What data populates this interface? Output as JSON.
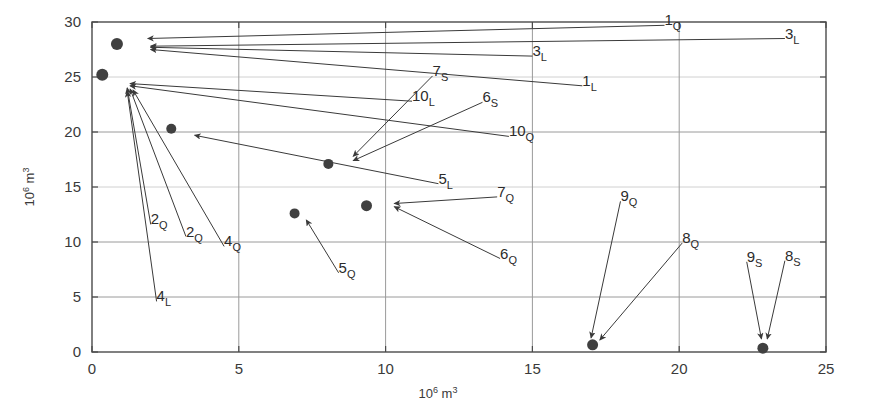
{
  "figure": {
    "background_color": "#ffffff",
    "axis_color": "#4a4a4a",
    "grid_color": "#9a9a9a",
    "marker_color": "#404040",
    "arrow_color": "#3a3a3a"
  },
  "chart_data": {
    "type": "scatter",
    "title": "",
    "xlabel": "10⁶ m³",
    "ylabel": "10⁶ m³",
    "xlim": [
      0,
      25
    ],
    "ylim": [
      0,
      30
    ],
    "xticks": [
      0,
      5,
      10,
      15,
      20,
      25
    ],
    "xtick_labels": [
      "0",
      "5",
      "10",
      "15",
      "20",
      "25"
    ],
    "yticks": [
      0,
      5,
      10,
      15,
      20,
      25,
      30
    ],
    "ytick_labels": [
      "0",
      "5",
      "10",
      "15",
      "20",
      "25",
      "30"
    ],
    "grid": true,
    "grid_x": [
      5,
      10,
      15,
      20
    ],
    "grid_y": [
      5,
      10,
      15,
      20,
      25
    ],
    "legend": "none",
    "points": [
      {
        "label": "1",
        "sub": "Q",
        "x": 0.85,
        "y": 28.1
      },
      {
        "label": "3",
        "sub": "L",
        "x": 0.85,
        "y": 27.9
      },
      {
        "label": "3",
        "sub": "L",
        "x": 0.9,
        "y": 27.6
      },
      {
        "label": "1",
        "sub": "L",
        "x": 0.9,
        "y": 27.4
      },
      {
        "label": "10",
        "sub": "L",
        "x": 0.35,
        "y": 24.6
      },
      {
        "label": "10",
        "sub": "Q",
        "x": 2.7,
        "y": 20.3
      },
      {
        "label": "5",
        "sub": "L",
        "x": 2.7,
        "y": 20.3
      },
      {
        "label": "2",
        "sub": "Q",
        "x": 0.35,
        "y": 24.4
      },
      {
        "label": "2",
        "sub": "Q",
        "x": 0.35,
        "y": 24.3
      },
      {
        "label": "4",
        "sub": "Q",
        "x": 0.35,
        "y": 24.2
      },
      {
        "label": "4",
        "sub": "L",
        "x": 0.35,
        "y": 24.1
      },
      {
        "label": "7",
        "sub": "S",
        "x": 8.05,
        "y": 17.1
      },
      {
        "label": "6",
        "sub": "S",
        "x": 8.05,
        "y": 17.1
      },
      {
        "label": "7",
        "sub": "Q",
        "x": 9.35,
        "y": 13.3
      },
      {
        "label": "6",
        "sub": "Q",
        "x": 9.35,
        "y": 13.3
      },
      {
        "label": "5",
        "sub": "Q",
        "x": 6.9,
        "y": 12.6
      },
      {
        "label": "9",
        "sub": "Q",
        "x": 17.05,
        "y": 0.65
      },
      {
        "label": "8",
        "sub": "Q",
        "x": 17.05,
        "y": 0.65
      },
      {
        "label": "9",
        "sub": "S",
        "x": 22.85,
        "y": 0.35
      },
      {
        "label": "8",
        "sub": "S",
        "x": 22.85,
        "y": 0.35
      }
    ],
    "markers": [
      {
        "name": "cluster-top-left",
        "x": 0.85,
        "y": 28.0,
        "r": 6.0
      },
      {
        "name": "cluster-mid-left",
        "x": 0.35,
        "y": 25.2,
        "r": 6.0
      },
      {
        "name": "marker-10q-5l",
        "x": 2.7,
        "y": 20.3,
        "r": 5.0
      },
      {
        "name": "marker-7s-6s",
        "x": 8.05,
        "y": 17.1,
        "r": 5.0
      },
      {
        "name": "marker-7q-6q",
        "x": 9.35,
        "y": 13.3,
        "r": 5.5
      },
      {
        "name": "marker-5q",
        "x": 6.9,
        "y": 12.6,
        "r": 5.0
      },
      {
        "name": "marker-9q-8q",
        "x": 17.05,
        "y": 0.65,
        "r": 5.5
      },
      {
        "name": "marker-9s-8s",
        "x": 22.85,
        "y": 0.35,
        "r": 5.5
      }
    ],
    "annotations": [
      {
        "text": "1",
        "sub": "Q",
        "label_x": 19.5,
        "label_y": 29.7,
        "tip_x": 1.9,
        "tip_y": 28.5
      },
      {
        "text": "3",
        "sub": "L",
        "label_x": 23.6,
        "label_y": 28.5,
        "tip_x": 2.0,
        "tip_y": 27.8
      },
      {
        "text": "3",
        "sub": "L",
        "label_x": 15.0,
        "label_y": 26.9,
        "tip_x": 2.0,
        "tip_y": 27.7
      },
      {
        "text": "1",
        "sub": "L",
        "label_x": 16.7,
        "label_y": 24.2,
        "tip_x": 2.0,
        "tip_y": 27.5
      },
      {
        "text": "10",
        "sub": "L",
        "label_x": 10.9,
        "label_y": 22.8,
        "tip_x": 1.3,
        "tip_y": 24.4
      },
      {
        "text": "10",
        "sub": "Q",
        "label_x": 14.2,
        "label_y": 19.6,
        "tip_x": 1.3,
        "tip_y": 24.2
      },
      {
        "text": "5",
        "sub": "L",
        "label_x": 11.8,
        "label_y": 15.3,
        "tip_x": 3.5,
        "tip_y": 19.7
      },
      {
        "text": "2",
        "sub": "Q",
        "label_x": 2.0,
        "label_y": 11.6,
        "tip_x": 1.2,
        "tip_y": 24.0
      },
      {
        "text": "2",
        "sub": "Q",
        "label_x": 3.2,
        "label_y": 10.5,
        "tip_x": 1.3,
        "tip_y": 23.9
      },
      {
        "text": "4",
        "sub": "Q",
        "label_x": 4.5,
        "label_y": 9.6,
        "tip_x": 1.4,
        "tip_y": 23.8
      },
      {
        "text": "4",
        "sub": "L",
        "label_x": 2.2,
        "label_y": 4.6,
        "tip_x": 1.2,
        "tip_y": 23.7
      },
      {
        "text": "7",
        "sub": "S",
        "label_x": 11.6,
        "label_y": 25.1,
        "tip_x": 8.9,
        "tip_y": 17.8
      },
      {
        "text": "6",
        "sub": "S",
        "label_x": 13.3,
        "label_y": 22.7,
        "tip_x": 8.9,
        "tip_y": 17.4
      },
      {
        "text": "7",
        "sub": "Q",
        "label_x": 13.8,
        "label_y": 14.1,
        "tip_x": 10.3,
        "tip_y": 13.5
      },
      {
        "text": "6",
        "sub": "Q",
        "label_x": 13.9,
        "label_y": 8.5,
        "tip_x": 10.3,
        "tip_y": 13.2
      },
      {
        "text": "5",
        "sub": "Q",
        "label_x": 8.4,
        "label_y": 7.2,
        "tip_x": 7.3,
        "tip_y": 12.0
      },
      {
        "text": "9",
        "sub": "Q",
        "label_x": 18.0,
        "label_y": 13.7,
        "tip_x": 17.0,
        "tip_y": 1.3
      },
      {
        "text": "8",
        "sub": "Q",
        "label_x": 20.1,
        "label_y": 9.9,
        "tip_x": 17.3,
        "tip_y": 1.1
      },
      {
        "text": "9",
        "sub": "S",
        "label_x": 22.3,
        "label_y": 8.2,
        "tip_x": 22.8,
        "tip_y": 1.2
      },
      {
        "text": "8",
        "sub": "S",
        "label_x": 23.6,
        "label_y": 8.3,
        "tip_x": 23.0,
        "tip_y": 1.2
      }
    ]
  }
}
